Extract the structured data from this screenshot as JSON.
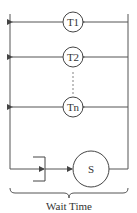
{
  "diagram": {
    "type": "queueing-system",
    "colors": {
      "stroke": "#444444",
      "text": "#333333",
      "background": "#ffffff"
    },
    "thinking_nodes": [
      {
        "id": "T1",
        "label": "T1"
      },
      {
        "id": "T2",
        "label": "T2"
      },
      {
        "id": "Tn",
        "label": "Tn"
      }
    ],
    "ellipsis": "⋮",
    "server": {
      "id": "S",
      "label": "S"
    },
    "queue": {
      "label": ""
    },
    "brace_caption": "Wait Time"
  }
}
